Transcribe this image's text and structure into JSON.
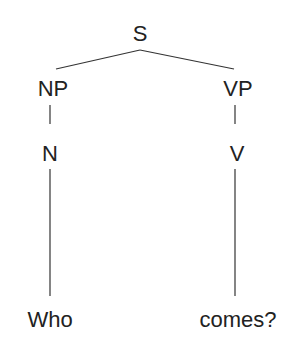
{
  "tree": {
    "root": {
      "label": "S"
    },
    "np": {
      "label": "NP"
    },
    "vp": {
      "label": "VP"
    },
    "n": {
      "label": "N"
    },
    "v": {
      "label": "V"
    },
    "word1": {
      "label": "Who"
    },
    "word2": {
      "label": "comes?"
    }
  },
  "colors": {
    "line": "#333333",
    "text": "#222222"
  }
}
